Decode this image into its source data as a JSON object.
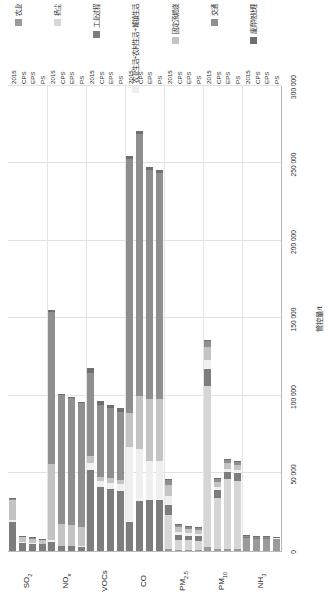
{
  "chart_data": {
    "type": "bar",
    "orientation": "horizontal-stacked",
    "title": "",
    "xlabel": "管控量/t",
    "ylabel": "",
    "xlim": [
      0,
      300000
    ],
    "xticks": [
      0,
      50000,
      100000,
      150000,
      200000,
      250000,
      300000
    ],
    "xticklabels": [
      "0",
      "50 000",
      "100 000",
      "150 000",
      "200 000",
      "250 000",
      "300 000"
    ],
    "grid": true,
    "legend_position": "bottom-right",
    "categories": [
      "SO₂",
      "NOₓ",
      "VOCs",
      "CO",
      "PM₂.₅",
      "PM₁₀",
      "NH₃"
    ],
    "scenarios": [
      "2015",
      "CPS",
      "EPS",
      "PS"
    ],
    "series": [
      {
        "name": "农业",
        "color": "#9a9a9a"
      },
      {
        "name": "扬尘",
        "color": "#d6d6d6"
      },
      {
        "name": "工业过程",
        "color": "#7d7d7d"
      },
      {
        "name": "农业生活+农村生活+城镇生活",
        "color": "#efefef"
      },
      {
        "name": "固定源燃烧",
        "color": "#c4c4c4"
      },
      {
        "name": "交通",
        "color": "#8f8f8f"
      },
      {
        "name": "废弃物处理",
        "color": "#6f6f6f"
      }
    ],
    "groups": [
      {
        "category": "SO₂",
        "bars": [
          {
            "scenario": "2015",
            "segments": [
              0,
              0,
              19000,
              900,
              13000,
              900,
              600
            ]
          },
          {
            "scenario": "CPS",
            "segments": [
              0,
              0,
              5200,
              300,
              3300,
              300,
              200
            ]
          },
          {
            "scenario": "EPS",
            "segments": [
              0,
              0,
              4600,
              300,
              2900,
              300,
              200
            ]
          },
          {
            "scenario": "PS",
            "segments": [
              0,
              0,
              4200,
              250,
              2700,
              250,
              200
            ]
          }
        ]
      },
      {
        "category": "NOₓ",
        "bars": [
          {
            "scenario": "2015",
            "segments": [
              0,
              0,
              6000,
              900,
              49000,
              98000,
              1500
            ]
          },
          {
            "scenario": "CPS",
            "segments": [
              0,
              0,
              3000,
              500,
              14000,
              83000,
              900
            ]
          },
          {
            "scenario": "EPS",
            "segments": [
              0,
              0,
              3000,
              500,
              13000,
              82000,
              900
            ]
          },
          {
            "scenario": "PS",
            "segments": [
              0,
              0,
              2800,
              500,
              12000,
              80000,
              900
            ]
          }
        ]
      },
      {
        "category": "VOCs",
        "bars": [
          {
            "scenario": "2015",
            "segments": [
              0,
              0,
              52000,
              5000,
              4000,
              54000,
              3000
            ]
          },
          {
            "scenario": "CPS",
            "segments": [
              0,
              0,
              41000,
              4000,
              3000,
              46000,
              2500
            ]
          },
          {
            "scenario": "EPS",
            "segments": [
              0,
              0,
              40000,
              4000,
              3000,
              45000,
              2500
            ]
          },
          {
            "scenario": "PS",
            "segments": [
              0,
              0,
              39000,
              4000,
              3000,
              44000,
              2500
            ]
          }
        ]
      },
      {
        "category": "CO",
        "bars": [
          {
            "scenario": "2015",
            "segments": [
              0,
              0,
              19000,
              48000,
              22000,
              164000,
              2000
            ]
          },
          {
            "scenario": "CPS",
            "segments": [
              0,
              0,
              32000,
              34000,
              34000,
              169000,
              2000
            ]
          },
          {
            "scenario": "EPS",
            "segments": [
              0,
              0,
              33000,
              25000,
              40000,
              148000,
              2000
            ]
          },
          {
            "scenario": "PS",
            "segments": [
              0,
              0,
              33000,
              25000,
              40000,
              146000,
              2000
            ]
          }
        ]
      },
      {
        "category": "PM₂.₅",
        "bars": [
          {
            "scenario": "2015",
            "segments": [
              1500,
              22000,
              6000,
              6000,
              7000,
              3500,
              600
            ]
          },
          {
            "scenario": "CPS",
            "segments": [
              700,
              6500,
              3000,
              2000,
              3000,
              1500,
              300
            ]
          },
          {
            "scenario": "EPS",
            "segments": [
              700,
              6200,
              2800,
              1800,
              2800,
              1400,
              300
            ]
          },
          {
            "scenario": "PS",
            "segments": [
              700,
              6000,
              2700,
              1700,
              2700,
              1300,
              300
            ]
          }
        ]
      },
      {
        "category": "PM₁₀",
        "bars": [
          {
            "scenario": "2015",
            "segments": [
              2500,
              104000,
              11000,
              6000,
              8000,
              4000,
              800
            ]
          },
          {
            "scenario": "CPS",
            "segments": [
              1200,
              33000,
              5000,
              2000,
              3500,
              1800,
              400
            ]
          },
          {
            "scenario": "EPS",
            "segments": [
              1200,
              45000,
              5000,
              2000,
              3500,
              1800,
              400
            ]
          },
          {
            "scenario": "PS",
            "segments": [
              1200,
              44000,
              5000,
              2000,
              3500,
              1800,
              400
            ]
          }
        ]
      },
      {
        "category": "NH₃",
        "bars": [
          {
            "scenario": "2015",
            "segments": [
              8500,
              0,
              300,
              200,
              200,
              400,
              200
            ]
          },
          {
            "scenario": "CPS",
            "segments": [
              8000,
              0,
              300,
              200,
              200,
              400,
              200
            ]
          },
          {
            "scenario": "EPS",
            "segments": [
              7800,
              0,
              300,
              200,
              200,
              400,
              200
            ]
          },
          {
            "scenario": "PS",
            "segments": [
              7600,
              0,
              300,
              200,
              200,
              400,
              200
            ]
          }
        ]
      }
    ]
  }
}
